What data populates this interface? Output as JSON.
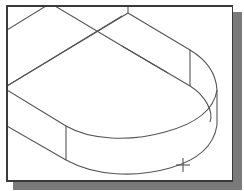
{
  "viewport": {
    "description": "Isometric CAD wireframe of a rounded-end slab (U-shaped/obround block) with a crosshair cursor",
    "colors": {
      "background": "#ffffff",
      "frame": "#3a3a3a",
      "shadow": "#7a7a7a",
      "lines": "#555555"
    }
  },
  "cursor": {
    "icon": "crosshair-icon",
    "x": 183,
    "y": 165
  }
}
